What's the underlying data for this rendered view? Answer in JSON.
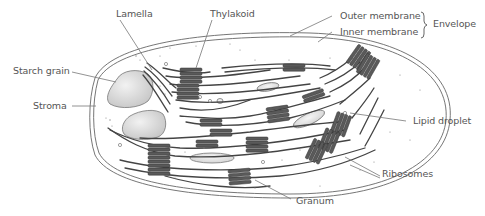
{
  "diagram": {
    "labels": {
      "lamella": "Lamella",
      "thylakoid": "Thylakoid",
      "outer_membrane": "Outer membrane",
      "inner_membrane": "Inner membrane",
      "envelope": "Envelope",
      "starch_grain": "Starch grain",
      "stroma": "Stroma",
      "lipid_droplet": "Lipid droplet",
      "ribosomes": "Ribosomes",
      "granum": "Granum"
    },
    "colors": {
      "outline": "#555555",
      "thylakoid_fill": "#5a5a5a",
      "starch_fill": "#d9d9d9",
      "droplet_fill": "#e6e6e6",
      "label_text": "#555555",
      "leader_line": "#777777"
    }
  }
}
